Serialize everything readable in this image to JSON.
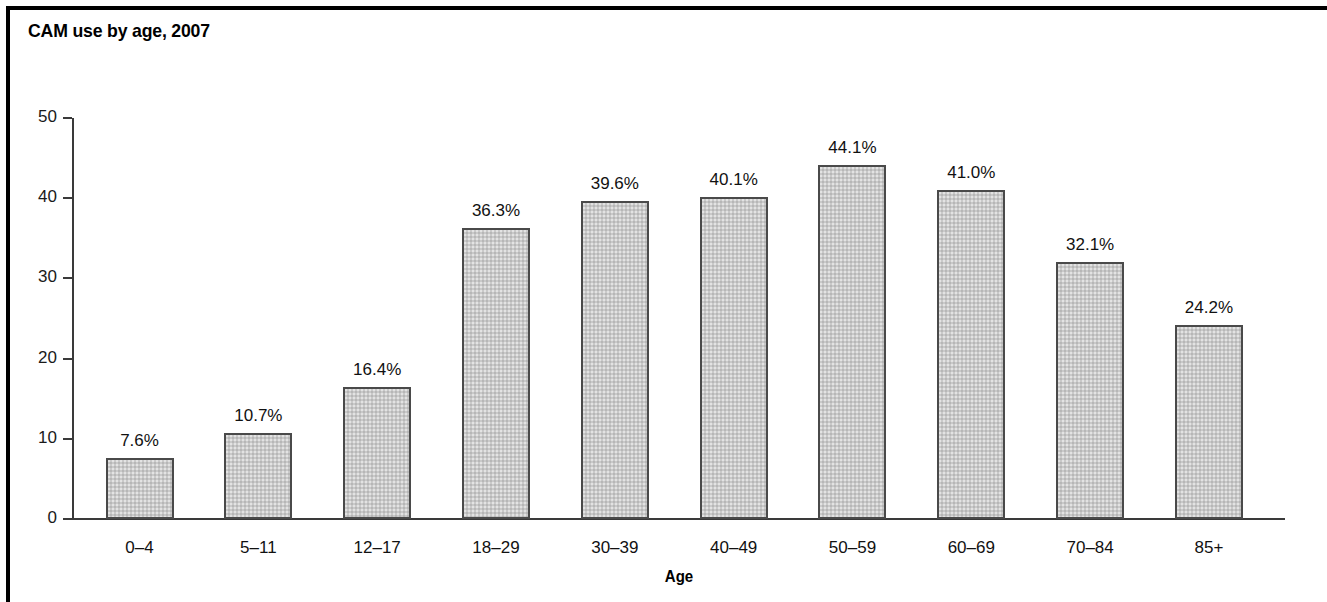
{
  "figure": {
    "title": "CAM use by age, 2007",
    "background": "#ffffff",
    "border_color": "#000000"
  },
  "chart_data": {
    "type": "bar",
    "title": "CAM use by age, 2007",
    "xlabel": "Age",
    "ylabel": "",
    "categories": [
      "0–4",
      "5–11",
      "12–17",
      "18–29",
      "30–39",
      "40–49",
      "50–59",
      "60–69",
      "70–84",
      "85+"
    ],
    "values": [
      7.6,
      10.7,
      16.4,
      36.3,
      39.6,
      40.1,
      44.1,
      41.0,
      32.1,
      24.2
    ],
    "value_labels": [
      "7.6%",
      "10.7%",
      "16.4%",
      "36.3%",
      "39.6%",
      "40.1%",
      "44.1%",
      "41.0%",
      "32.1%",
      "24.2%"
    ],
    "ylim": [
      0,
      50
    ],
    "yticks": [
      0,
      10,
      20,
      30,
      40,
      50
    ],
    "ytick_labels": [
      "0",
      "10",
      "20",
      "30",
      "40",
      "50"
    ],
    "grid": false,
    "legend": null,
    "bar_fill": "#c9c9c9",
    "bar_edge": "#4a4a4a"
  }
}
